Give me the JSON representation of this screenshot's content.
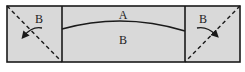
{
  "diagram": {
    "panels": [
      {
        "id": "left",
        "label": "B"
      },
      {
        "id": "center",
        "top_label": "A",
        "bottom_label": "B"
      },
      {
        "id": "right",
        "label": "B"
      }
    ],
    "colors": {
      "fill": "#d9d9d9",
      "stroke": "#1a1a1a",
      "background": "#ffffff"
    }
  }
}
